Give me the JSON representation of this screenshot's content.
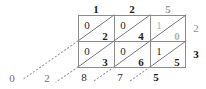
{
  "diagram": {
    "kind": "lattice-multiplication-grid",
    "top_factors": [
      {
        "digit": "1",
        "style": "dark"
      },
      {
        "digit": "2",
        "style": "dark"
      },
      {
        "digit": "5",
        "style": "dim"
      }
    ],
    "right_factors": [
      {
        "digit": "2",
        "style": "dim"
      },
      {
        "digit": "3",
        "style": "bold"
      }
    ],
    "cells": [
      {
        "row": 0,
        "col": 0,
        "tens": "0",
        "units": "2",
        "style": "dark"
      },
      {
        "row": 0,
        "col": 1,
        "tens": "0",
        "units": "4",
        "style": "dark"
      },
      {
        "row": 0,
        "col": 2,
        "tens": "1",
        "units": "0",
        "style": "dim"
      },
      {
        "row": 1,
        "col": 0,
        "tens": "0",
        "units": "3",
        "style": "dark"
      },
      {
        "row": 1,
        "col": 1,
        "tens": "0",
        "units": "6",
        "style": "dark"
      },
      {
        "row": 1,
        "col": 2,
        "tens": "1",
        "units": "5",
        "style": "dark"
      }
    ],
    "result_digits": [
      {
        "digit": "0",
        "style": "dim"
      },
      {
        "digit": "2",
        "style": "dim"
      },
      {
        "digit": "8",
        "style": "dark"
      },
      {
        "digit": "7",
        "style": "dark"
      },
      {
        "digit": "5",
        "style": "bold"
      }
    ]
  }
}
